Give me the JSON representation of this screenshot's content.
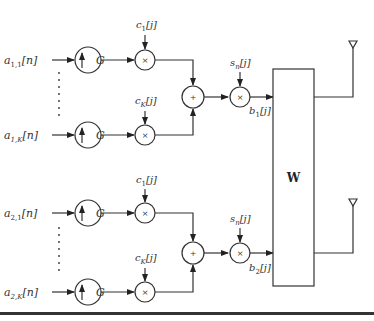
{
  "diagram": {
    "type": "block-diagram",
    "branches": [
      {
        "inputs": [
          {
            "label": "a",
            "sub": "1,1",
            "arg": "[n]"
          },
          {
            "label": "a",
            "sub": "1,K",
            "arg": "[n]"
          }
        ],
        "upsampler_label": "G",
        "codes": [
          {
            "label": "c",
            "sub": "1",
            "arg": "[j]"
          },
          {
            "label": "c",
            "sub": "K",
            "arg": "[j]"
          }
        ],
        "adder_symbol": "+",
        "multiplier_symbol": "×",
        "scrambler": {
          "label": "s",
          "sub": "n",
          "arg": "[j]"
        },
        "output": {
          "label": "b",
          "sub": "1",
          "arg": "[j]"
        }
      },
      {
        "inputs": [
          {
            "label": "a",
            "sub": "2,1",
            "arg": "[n]"
          },
          {
            "label": "a",
            "sub": "2,K",
            "arg": "[n]"
          }
        ],
        "upsampler_label": "G",
        "codes": [
          {
            "label": "c",
            "sub": "1",
            "arg": "[j]"
          },
          {
            "label": "c",
            "sub": "K",
            "arg": "[j]"
          }
        ],
        "adder_symbol": "+",
        "multiplier_symbol": "×",
        "scrambler": {
          "label": "s",
          "sub": "n",
          "arg": "[j]"
        },
        "output": {
          "label": "b",
          "sub": "2",
          "arg": "[j]"
        }
      }
    ],
    "precoder_label": "W",
    "antennas": 2,
    "colors": {
      "stroke": "#333333",
      "background": "#ffffff"
    }
  }
}
